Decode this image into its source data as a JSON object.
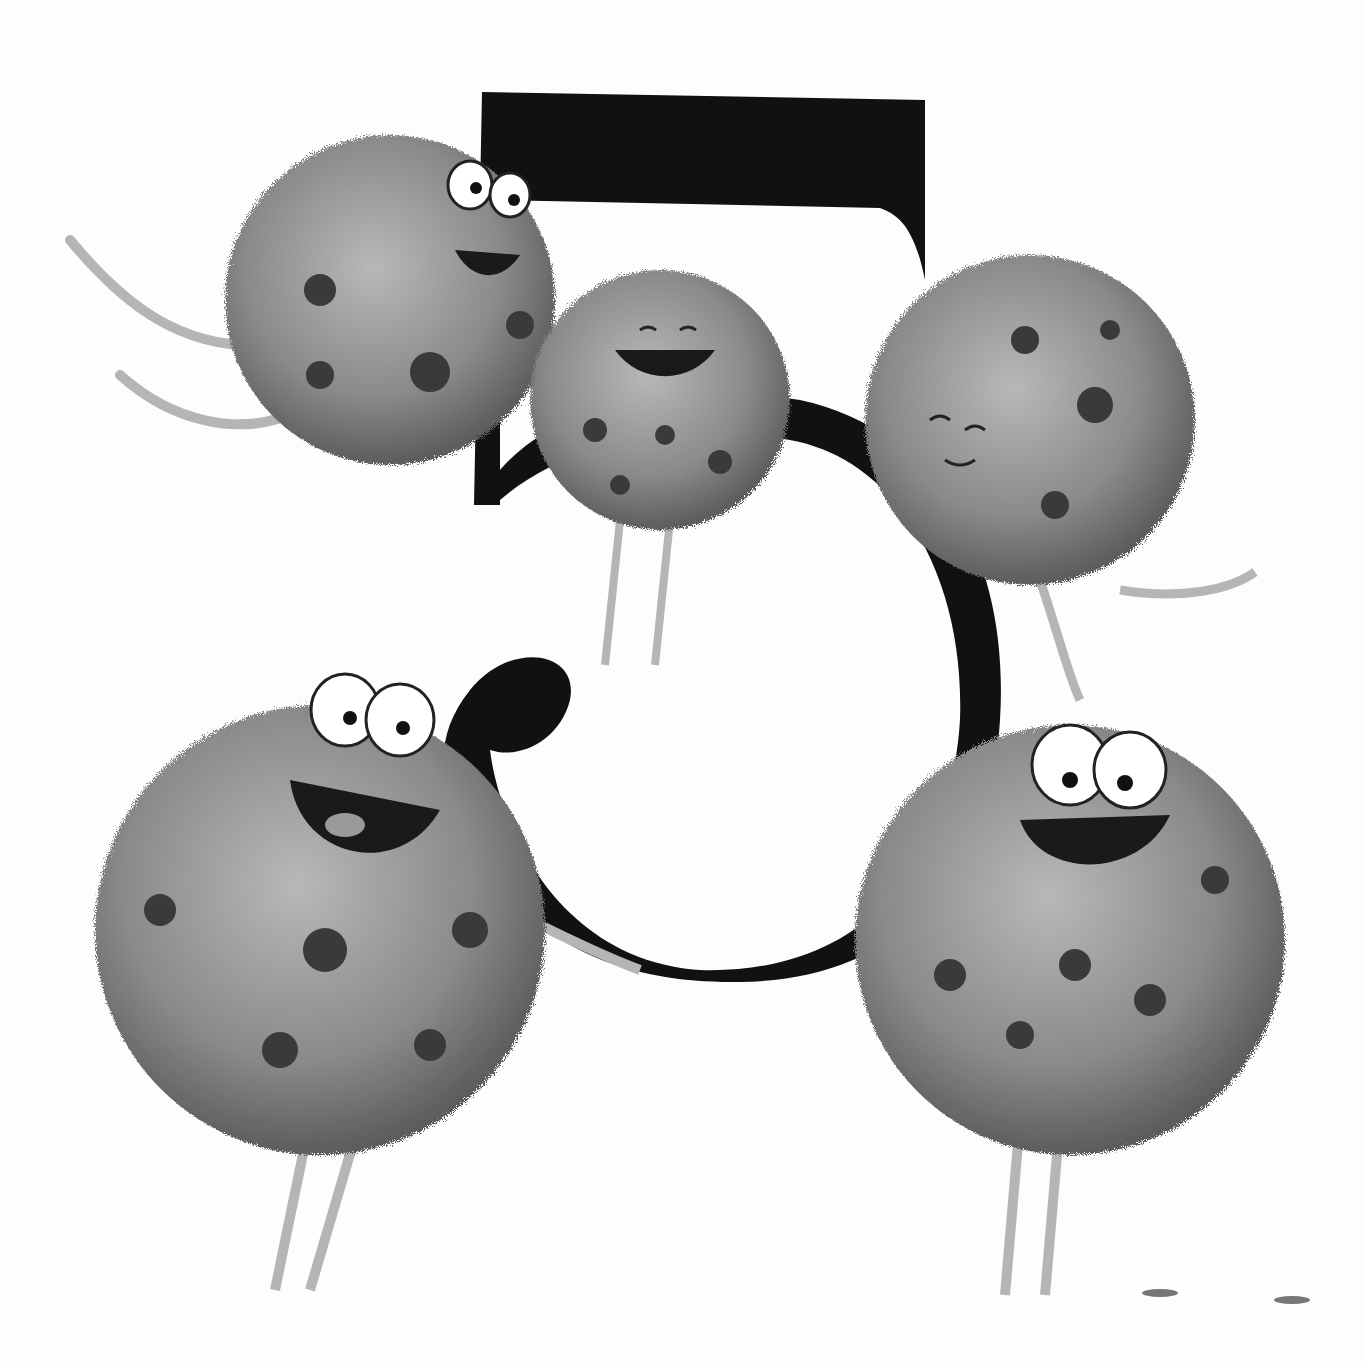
{
  "illustration": {
    "subject": "numeral five with fuzzy creatures",
    "numeral": "5",
    "creature_count": 5,
    "colors": {
      "background": "#fdfdfd",
      "numeral": "#111111",
      "creature_body": "#8a8a8a",
      "creature_shadow": "#5c5c5c",
      "spots": "#3a3a3a",
      "eye_white": "#ffffff",
      "mouth": "#1a1a1a",
      "limbs": "#b5b5b5"
    },
    "creatures": [
      {
        "id": "top-left",
        "cx": 390,
        "cy": 300,
        "r": 165,
        "expression": "grinning, eyes open",
        "eyes": true
      },
      {
        "id": "top-middle",
        "cx": 660,
        "cy": 400,
        "r": 130,
        "expression": "smiling, eyes closed",
        "eyes": false
      },
      {
        "id": "top-right",
        "cx": 1030,
        "cy": 420,
        "r": 165,
        "expression": "content, eyes closed",
        "eyes": false
      },
      {
        "id": "bottom-left",
        "cx": 320,
        "cy": 930,
        "r": 225,
        "expression": "laughing, tongue out",
        "eyes": true
      },
      {
        "id": "bottom-right",
        "cx": 1070,
        "cy": 940,
        "r": 215,
        "expression": "laughing, eyes open",
        "eyes": true
      }
    ]
  }
}
